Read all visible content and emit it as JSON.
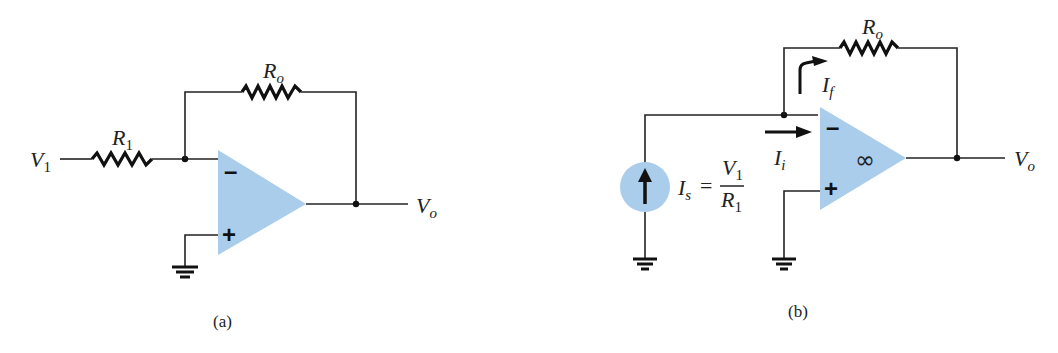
{
  "figure": {
    "panels": [
      {
        "id": "a",
        "caption": "(a)",
        "labels": {
          "input_voltage": {
            "main": "V",
            "sub": "1"
          },
          "input_resistor": {
            "main": "R",
            "sub": "1"
          },
          "feedback_resistor": {
            "main": "R",
            "sub": "o"
          },
          "output_voltage": {
            "main": "V",
            "sub": "o"
          }
        },
        "opamp": {
          "minus": "–",
          "plus": "+"
        }
      },
      {
        "id": "b",
        "caption": "(b)",
        "labels": {
          "feedback_resistor": {
            "main": "R",
            "sub": "o"
          },
          "feedback_current": {
            "main": "I",
            "sub": "f"
          },
          "input_current": {
            "main": "I",
            "sub": "i"
          },
          "source_current": {
            "main": "I",
            "sub": "s"
          },
          "equals": "=",
          "fraction_num": {
            "main": "V",
            "sub": "1"
          },
          "fraction_den": {
            "main": "R",
            "sub": "1"
          },
          "output_voltage": {
            "main": "V",
            "sub": "o"
          }
        },
        "opamp": {
          "minus": "–",
          "plus": "+",
          "gain": "∞"
        }
      }
    ],
    "colors": {
      "opamp_fill": "#a9cdea",
      "source_fill": "#a9cdea",
      "wire": "#222222"
    }
  }
}
